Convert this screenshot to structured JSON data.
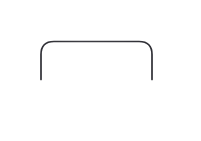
{
  "figure": {
    "background_color": "#ffffff",
    "width": 201,
    "height": 141
  },
  "chart_data": {
    "type": "line",
    "title": "",
    "subtitle": "",
    "xlabel": "",
    "ylabel": "",
    "grid": false,
    "legend": null,
    "axes": {
      "x_axis": {
        "label": "",
        "pixel_y": 79,
        "pixel_x_start": 10,
        "pixel_x_end": 187,
        "color_left_segment": "#b4b4b4",
        "color_right_segment": "#3c3c41",
        "stroke_width": 1.6,
        "tick_labels": []
      },
      "y_axis": {
        "label": "",
        "pixel_x": 97,
        "pixel_y_start": 9,
        "pixel_y_end": 128,
        "color_top_segment": "#45454b",
        "color_bottom_segment": "#a9a9ae",
        "stroke_width": 1.6,
        "tick_labels": []
      },
      "origin": {
        "pixel_x": 97,
        "pixel_y": 79
      },
      "xlim": [
        10,
        187
      ],
      "ylim": [
        128,
        9
      ]
    },
    "series": [
      {
        "name": "rectangular pulse",
        "color": "#37373c",
        "stroke_width": 1.7,
        "fill": "none",
        "corner_radius": 13,
        "points": [
          {
            "x": 41,
            "y": 79
          },
          {
            "x": 41,
            "y": 54
          },
          {
            "x": 54,
            "y": 41
          },
          {
            "x": 139,
            "y": 41
          },
          {
            "x": 152,
            "y": 54
          },
          {
            "x": 152,
            "y": 79
          }
        ],
        "plateau_top_y": 41,
        "left_edge_x": 41,
        "right_edge_x": 152,
        "baseline_y": 79,
        "pulse_width": 111,
        "pulse_height": 38,
        "centered_on_y_axis": true
      }
    ],
    "annotations": []
  }
}
